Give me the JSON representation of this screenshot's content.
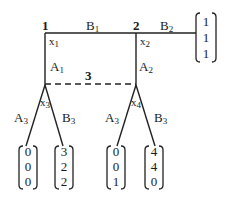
{
  "diagram": {
    "type": "extensive-form game tree",
    "nodes": {
      "n1": {
        "label": "1",
        "info": "x",
        "info_sub": "1"
      },
      "n2": {
        "label": "2",
        "info": "x",
        "info_sub": "2"
      },
      "n3": {
        "info": "x",
        "info_sub": "3"
      },
      "n4": {
        "info": "x",
        "info_sub": "4"
      }
    },
    "info_set_label": "3",
    "edges": {
      "b1": {
        "main": "B",
        "sub": "1"
      },
      "b2": {
        "main": "B",
        "sub": "2"
      },
      "a1": {
        "main": "A",
        "sub": "1"
      },
      "a2": {
        "main": "A",
        "sub": "2"
      },
      "x3_a3": {
        "main": "A",
        "sub": "3"
      },
      "x3_b3": {
        "main": "B",
        "sub": "3"
      },
      "x4_a3": {
        "main": "A",
        "sub": "3"
      },
      "x4_b3": {
        "main": "B",
        "sub": "3"
      }
    },
    "payoffs": {
      "b2": [
        "1",
        "1",
        "1"
      ],
      "x3_a3": [
        "0",
        "0",
        "0"
      ],
      "x3_b3": [
        "3",
        "2",
        "2"
      ],
      "x4_a3": [
        "0",
        "0",
        "1"
      ],
      "x4_b3": [
        "4",
        "4",
        "0"
      ]
    }
  }
}
